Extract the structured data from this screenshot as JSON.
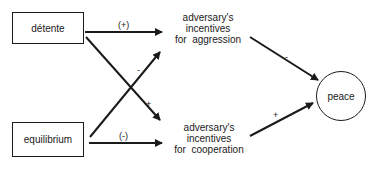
{
  "nodes": {
    "detente": {
      "label": "détente"
    },
    "equilibrium": {
      "label": "equilibrium"
    },
    "aggression": {
      "line1": "adversary's",
      "line2": "incentives",
      "line3": "for  aggression"
    },
    "cooperation": {
      "line1": "adversary's",
      "line2": "incentives",
      "line3": "for  cooperation"
    },
    "peace": {
      "label": "peace"
    }
  },
  "edges": [
    {
      "from": "detente",
      "to": "aggression",
      "sign": "(+)"
    },
    {
      "from": "detente",
      "to": "cooperation",
      "sign": "+"
    },
    {
      "from": "equilibrium",
      "to": "aggression",
      "sign": "-"
    },
    {
      "from": "equilibrium",
      "to": "cooperation",
      "sign": "(-)"
    },
    {
      "from": "aggression",
      "to": "peace",
      "sign": "-"
    },
    {
      "from": "cooperation",
      "to": "peace",
      "sign": "+"
    }
  ],
  "colors": {
    "stroke": "#1a1a1a",
    "background": "#ffffff"
  }
}
